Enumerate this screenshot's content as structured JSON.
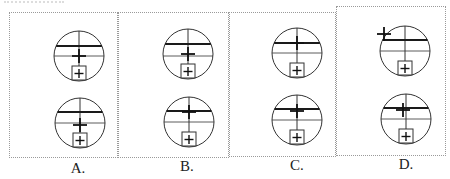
{
  "figure": {
    "type": "multiple-choice leveling reticle diagrams",
    "panels": [
      {
        "label": "A.",
        "frame": {
          "x": 9,
          "y": 12,
          "w": 109,
          "h": 146
        },
        "views": [
          {
            "cx": 79,
            "cy": 56,
            "r": 25,
            "thick_line_y": 46,
            "thin_line_y": 56,
            "cross": {
              "x": 79,
              "y": 56
            }
          },
          {
            "cx": 80,
            "cy": 123,
            "r": 25,
            "thick_line_y": 112,
            "thin_line_y": 123,
            "cross": {
              "x": 80,
              "y": 125
            }
          }
        ]
      },
      {
        "label": "B.",
        "frame": {
          "x": 118,
          "y": 12,
          "w": 111,
          "h": 146
        },
        "views": [
          {
            "cx": 188,
            "cy": 54,
            "r": 25,
            "thick_line_y": 44,
            "thin_line_y": 56,
            "cross": {
              "x": 188,
              "y": 54
            }
          },
          {
            "cx": 189,
            "cy": 122,
            "r": 25,
            "thick_line_y": 111,
            "thin_line_y": 122,
            "cross": {
              "x": 189,
              "y": 112
            }
          }
        ]
      },
      {
        "label": "C.",
        "frame": {
          "x": 229,
          "y": 12,
          "w": 107,
          "h": 145
        },
        "views": [
          {
            "cx": 297,
            "cy": 53,
            "r": 25,
            "thick_line_y": 43,
            "thin_line_y": 53,
            "cross": {
              "x": 297,
              "y": 43
            }
          },
          {
            "cx": 297,
            "cy": 120,
            "r": 25,
            "thick_line_y": 109,
            "thin_line_y": 120,
            "cross": {
              "x": 297,
              "y": 111
            }
          }
        ]
      },
      {
        "label": "D.",
        "frame": {
          "x": 336,
          "y": 6,
          "w": 110,
          "h": 150
        },
        "views": [
          {
            "cx": 405,
            "cy": 51,
            "r": 25,
            "thick_line_y": 40,
            "thin_line_y": 51,
            "cross": {
              "x": 384,
              "y": 34
            }
          },
          {
            "cx": 406,
            "cy": 119,
            "r": 25,
            "thick_line_y": 108,
            "thin_line_y": 119,
            "cross": {
              "x": 403,
              "y": 110
            }
          }
        ]
      }
    ],
    "stroke_color": "#333333",
    "thick_line_color": "#1a1a1a",
    "frame_color": "#9a9a9a"
  }
}
